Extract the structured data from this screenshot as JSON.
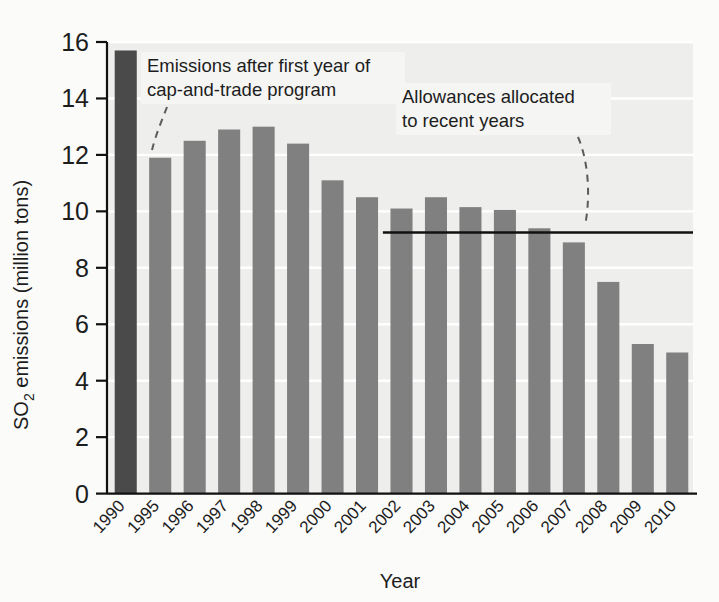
{
  "chart_data": {
    "type": "bar",
    "title": "",
    "xlabel": "Year",
    "ylabel": "SO2 emissions (million tons)",
    "ylabel_parts": {
      "prefix": "SO",
      "sub": "2",
      "suffix": " emissions (million tons)"
    },
    "categories": [
      "1990",
      "1995",
      "1996",
      "1997",
      "1998",
      "1999",
      "2000",
      "2001",
      "2002",
      "2003",
      "2004",
      "2005",
      "2006",
      "2007",
      "2008",
      "2009",
      "2010"
    ],
    "values": [
      15.7,
      11.9,
      12.5,
      12.9,
      13.0,
      12.4,
      11.1,
      10.5,
      10.1,
      10.5,
      10.15,
      10.05,
      9.4,
      8.9,
      7.5,
      5.3,
      5.0
    ],
    "bar_colors": [
      "#4a4a4a",
      "#808080",
      "#808080",
      "#808080",
      "#808080",
      "#808080",
      "#808080",
      "#808080",
      "#808080",
      "#808080",
      "#808080",
      "#808080",
      "#808080",
      "#808080",
      "#808080",
      "#808080",
      "#808080"
    ],
    "ylim": [
      0,
      16
    ],
    "yticks": [
      0,
      2,
      4,
      6,
      8,
      10,
      12,
      14,
      16
    ],
    "ytick_labels": [
      "0",
      "2",
      "4",
      "6",
      "8",
      "10",
      "12",
      "14",
      "16"
    ],
    "grid": true,
    "legend": "none",
    "reference_line": {
      "label": "Allowances allocated to recent years",
      "value": 9.25,
      "start_category": "2002",
      "end_category": "2010",
      "color": "#111111"
    },
    "annotations": [
      {
        "id": "emissions-first-year",
        "line1": "Emissions after first year of",
        "line2": "cap-and-trade program",
        "points_to_category": "1995",
        "points_to_value": 11.9
      },
      {
        "id": "allowances-allocated",
        "line1": "Allowances allocated",
        "line2": "to recent years",
        "points_to_value": 9.25
      }
    ]
  },
  "figure": {
    "background_color": "#fbfbfa",
    "plot_background_color": "#eeeeec",
    "gridline_color": "#ffffff",
    "axis_color": "#111111",
    "annotation_background": "#f5f5f4"
  }
}
